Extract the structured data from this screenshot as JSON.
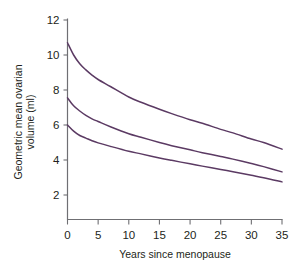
{
  "chart_data": {
    "type": "line",
    "title": "",
    "xlabel": "Years since menopause",
    "ylabel": "Geometric mean ovarian volume (ml)",
    "ylabel_line1": "Geometric mean ovarian",
    "ylabel_line2": "volume (ml)",
    "xlim": [
      0,
      35
    ],
    "ylim": [
      0,
      12
    ],
    "xticks": [
      0,
      5,
      10,
      15,
      20,
      25,
      30,
      35
    ],
    "yticks": [
      2,
      4,
      6,
      8,
      10,
      12
    ],
    "xtick_labels": [
      "0",
      "5",
      "10",
      "15",
      "20",
      "25",
      "30",
      "35"
    ],
    "ytick_labels": [
      "2",
      "4",
      "6",
      "8",
      "10",
      "12"
    ],
    "grid": false,
    "legend": "none",
    "line_color": "#5b3a63",
    "axis_color": "#6f6f73",
    "x": [
      0,
      1,
      2,
      3,
      4,
      5,
      7,
      10,
      12,
      15,
      17,
      20,
      22,
      25,
      27,
      30,
      32,
      35
    ],
    "series": [
      {
        "name": "upper-curve",
        "values": [
          10.7,
          10.0,
          9.5,
          9.15,
          8.85,
          8.6,
          8.2,
          7.6,
          7.3,
          6.9,
          6.65,
          6.3,
          6.1,
          5.75,
          5.55,
          5.2,
          5.0,
          4.62
        ]
      },
      {
        "name": "middle-curve",
        "values": [
          7.55,
          7.1,
          6.8,
          6.55,
          6.35,
          6.2,
          5.9,
          5.5,
          5.3,
          5.0,
          4.82,
          4.58,
          4.42,
          4.2,
          4.05,
          3.8,
          3.62,
          3.32
        ]
      },
      {
        "name": "lower-curve",
        "values": [
          6.0,
          5.65,
          5.4,
          5.25,
          5.1,
          4.98,
          4.78,
          4.5,
          4.35,
          4.12,
          3.98,
          3.78,
          3.65,
          3.46,
          3.33,
          3.13,
          2.99,
          2.75
        ]
      }
    ]
  }
}
